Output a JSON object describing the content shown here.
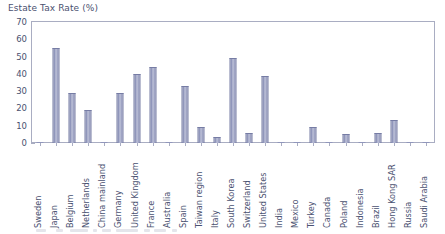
{
  "chart_data": {
    "type": "bar",
    "title": "Estate Tax Rate (%)",
    "xlabel": "",
    "ylabel": "",
    "ylim": [
      0,
      70
    ],
    "yticks": [
      0,
      10,
      20,
      30,
      40,
      50,
      60,
      70
    ],
    "grid": false,
    "legend": null,
    "bar_color": "#9096bb",
    "bar_edge_color": "#767ca4",
    "text_color": "#4a5170",
    "axis_color": "#a9adc2",
    "categories": [
      "Sweden",
      "Japan",
      "Belgium",
      "Netherlands",
      "China mainland",
      "Germany",
      "United Kingdom",
      "France",
      "Australia",
      "Spain",
      "Taiwan region",
      "Italy",
      "South Korea",
      "Switzerland",
      "United States",
      "India",
      "Mexico",
      "Turkey",
      "Canada",
      "Poland",
      "Indonesia",
      "Brazil",
      "Hong Kong SAR",
      "Russia",
      "Saudi Arabia"
    ],
    "values": [
      0,
      55,
      29,
      19,
      0,
      29,
      40,
      44,
      0,
      33,
      9,
      3.5,
      49,
      6,
      39,
      0,
      0,
      9,
      0,
      5.5,
      0,
      6,
      13.5,
      0,
      0
    ]
  }
}
